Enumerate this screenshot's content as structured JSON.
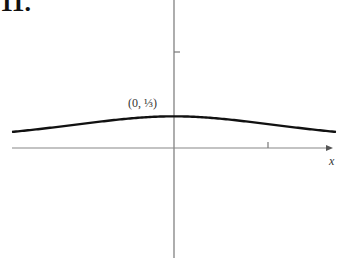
{
  "figure": {
    "label": "11."
  },
  "chart_data": {
    "type": "line",
    "title": "",
    "function": "y = 1/(x^2 + 3)",
    "xlabel": "x",
    "ylabel": "",
    "xlim": [
      -1.8,
      1.7
    ],
    "ylim": [
      -1.15,
      1.55
    ],
    "x_ticks": [
      1
    ],
    "y_ticks": [
      1
    ],
    "grid": false,
    "legend": null,
    "annotations": [
      {
        "text": "(0, ⅓)",
        "x": 0,
        "y": 0.3333
      }
    ],
    "series": [
      {
        "name": "f(x)",
        "x": [
          -1.75,
          -1.5,
          -1.0,
          -0.5,
          0,
          0.5,
          1.0,
          1.5,
          1.7
        ],
        "values": [
          0.165,
          0.19,
          0.25,
          0.308,
          0.333,
          0.308,
          0.25,
          0.19,
          0.17
        ]
      }
    ],
    "colors": {
      "curve": "#111111",
      "axes": "#777777"
    }
  }
}
